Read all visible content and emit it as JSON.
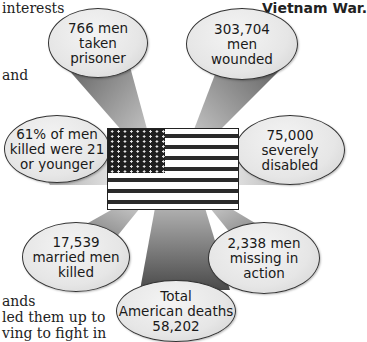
{
  "background_text": {
    "line1": "interests",
    "line2": "and",
    "line3": "ands",
    "line4": "led them up to",
    "line5": "ving to fight in"
  },
  "heading": "Vietnam War.",
  "center": {
    "icon": "us-flag-icon"
  },
  "stats": [
    {
      "id": "prisoners",
      "text": "766 men\ntaken\nprisoner"
    },
    {
      "id": "wounded",
      "text": "303,704\nmen\nwounded"
    },
    {
      "id": "young",
      "text": "61% of men\nkilled were 21\nor younger"
    },
    {
      "id": "disabled",
      "text": "75,000\nseverely\ndisabled"
    },
    {
      "id": "married",
      "text": "17,539\nmarried men\nkilled"
    },
    {
      "id": "missing",
      "text": "2,338 men\nmissing in\naction"
    },
    {
      "id": "total",
      "text": "Total\nAmerican deaths\n58,202"
    }
  ],
  "colors": {
    "beam_dark": "#555555",
    "beam_light": "#d8d8d8",
    "ellipse_fill": "#e6e6e6",
    "outline": "#333333"
  }
}
